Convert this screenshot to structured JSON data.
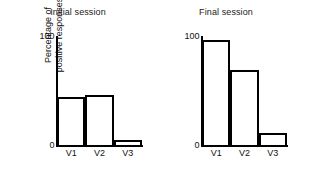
{
  "figure": {
    "background_color": "#ffffff",
    "line_color": "#000000",
    "bar_fill_color": "#ffffff"
  },
  "axis": {
    "y_title_line1": "Percentage of",
    "y_title_line2": "positive responses",
    "y_tick_top": "100",
    "y_tick_bottom": "0"
  },
  "panels": [
    {
      "title": "Initial session",
      "categories": [
        "V1",
        "V2",
        "V3"
      ],
      "values": [
        44,
        46,
        5
      ]
    },
    {
      "title": "Final session",
      "categories": [
        "V1",
        "V2",
        "V3"
      ],
      "values": [
        96,
        69,
        11
      ]
    }
  ],
  "chart_data": {
    "type": "bar",
    "title": "",
    "xlabel": "",
    "ylabel": "Percentage of positive responses",
    "ylim": [
      0,
      100
    ],
    "yticks": [
      0,
      100
    ],
    "ytick_labels": [
      "0",
      "100"
    ],
    "grid": false,
    "legend": null,
    "panels": [
      {
        "panel_title": "Initial session",
        "categories": [
          "V1",
          "V2",
          "V3"
        ],
        "values": [
          44,
          46,
          5
        ]
      },
      {
        "panel_title": "Final session",
        "categories": [
          "V1",
          "V2",
          "V3"
        ],
        "values": [
          96,
          69,
          11
        ]
      }
    ],
    "series": [
      {
        "name": "Initial session",
        "values": [
          44,
          46,
          5
        ]
      },
      {
        "name": "Final session",
        "values": [
          96,
          69,
          11
        ]
      }
    ],
    "categories": [
      "V1",
      "V2",
      "V3"
    ]
  }
}
